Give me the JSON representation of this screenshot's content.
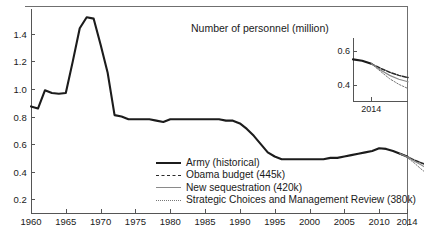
{
  "chart_data": {
    "type": "line",
    "title": "Number of personnel (million)",
    "xlabel": "",
    "ylabel": "",
    "xlim": [
      1960,
      2014
    ],
    "ylim": [
      0.1,
      1.58
    ],
    "grid": false,
    "legend_position": "bottom-center",
    "x_ticks": [
      "1960",
      "1965",
      "1970",
      "1975",
      "1980",
      "1985",
      "1990",
      "1995",
      "2000",
      "2005",
      "2010",
      "2014"
    ],
    "y_ticks": [
      "0.2",
      "0.4",
      "0.6",
      "0.8",
      "1.0",
      "1.2",
      "1.4"
    ],
    "series": [
      {
        "name": "Army (historical)",
        "style": "solid-thick",
        "color": "#1c1c1c",
        "x": [
          1960,
          1961,
          1962,
          1963,
          1964,
          1965,
          1966,
          1967,
          1968,
          1969,
          1970,
          1971,
          1972,
          1973,
          1974,
          1975,
          1976,
          1977,
          1978,
          1979,
          1980,
          1981,
          1982,
          1983,
          1984,
          1985,
          1986,
          1987,
          1988,
          1989,
          1990,
          1991,
          1992,
          1993,
          1994,
          1995,
          1996,
          1997,
          1998,
          1999,
          2000,
          2001,
          2002,
          2003,
          2004,
          2005,
          2006,
          2007,
          2008,
          2009,
          2010,
          2011,
          2012,
          2013,
          2014
        ],
        "values": [
          0.873,
          0.858,
          0.99,
          0.97,
          0.965,
          0.97,
          1.2,
          1.44,
          1.52,
          1.51,
          1.32,
          1.12,
          0.81,
          0.8,
          0.78,
          0.78,
          0.78,
          0.78,
          0.77,
          0.76,
          0.78,
          0.78,
          0.78,
          0.78,
          0.78,
          0.78,
          0.78,
          0.78,
          0.77,
          0.77,
          0.75,
          0.71,
          0.66,
          0.6,
          0.54,
          0.51,
          0.49,
          0.49,
          0.49,
          0.49,
          0.49,
          0.49,
          0.49,
          0.5,
          0.5,
          0.51,
          0.52,
          0.53,
          0.54,
          0.55,
          0.57,
          0.565,
          0.55,
          0.53,
          0.51
        ]
      },
      {
        "name": "Obama budget (445k)",
        "style": "dashed",
        "color": "#2b2b2b",
        "endpoint_label": "445k",
        "x": [
          2013,
          2014,
          2015,
          2016,
          2017
        ],
        "values": [
          0.53,
          0.51,
          0.485,
          0.465,
          0.445
        ]
      },
      {
        "name": "New sequestration (420k)",
        "style": "solid-thin-gray",
        "color": "#8a8a8a",
        "endpoint_label": "420k",
        "x": [
          2013,
          2014,
          2015,
          2016,
          2017
        ],
        "values": [
          0.53,
          0.508,
          0.478,
          0.45,
          0.42
        ]
      },
      {
        "name": "Strategic Choices and Management Review (380k)",
        "style": "dotted",
        "color": "#777777",
        "endpoint_label": "380k",
        "x": [
          2013,
          2014,
          2015,
          2016,
          2017
        ],
        "values": [
          0.53,
          0.503,
          0.465,
          0.42,
          0.38
        ]
      }
    ],
    "inset": {
      "title": "",
      "xlim": [
        2012,
        2018
      ],
      "ylim": [
        0.3,
        0.68
      ],
      "x_ticks": [
        "2014"
      ],
      "y_ticks": [
        "0.4",
        "0.6"
      ],
      "series": [
        {
          "name": "Army (historical)",
          "style": "solid-thick",
          "x": [
            2012,
            2013,
            2014
          ],
          "values": [
            0.553,
            0.545,
            0.527
          ]
        },
        {
          "name": "Obama budget (445k)",
          "style": "dashed",
          "x": [
            2014,
            2015,
            2016,
            2017,
            2018
          ],
          "values": [
            0.527,
            0.5,
            0.477,
            0.458,
            0.445
          ]
        },
        {
          "name": "New sequestration (420k)",
          "style": "solid-thin-gray",
          "x": [
            2014,
            2015,
            2016,
            2017,
            2018
          ],
          "values": [
            0.527,
            0.49,
            0.458,
            0.435,
            0.42
          ]
        },
        {
          "name": "Strategic Choices and Management Review (380k)",
          "style": "dotted",
          "x": [
            2014,
            2015,
            2016,
            2017,
            2018
          ],
          "values": [
            0.527,
            0.482,
            0.438,
            0.405,
            0.38
          ]
        }
      ]
    }
  },
  "legend": {
    "items": [
      {
        "label": "Army (historical)"
      },
      {
        "label": "Obama budget (445k)"
      },
      {
        "label": "New sequestration (420k)"
      },
      {
        "label": "Strategic Choices and Management Review (380k)"
      }
    ]
  }
}
